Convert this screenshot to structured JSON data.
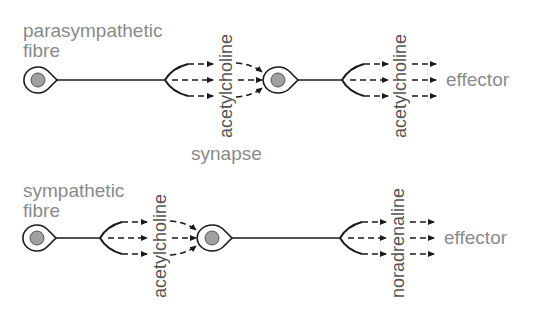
{
  "diagram": {
    "title": "",
    "rows": [
      {
        "id": "parasympathetic",
        "fibre_label_line1": "parasympathetic",
        "fibre_label_line2": "fibre",
        "first_transmitter": "acetylcholine",
        "second_transmitter": "acetylcholine",
        "synapse_label": "synapse",
        "target_label": "effector"
      },
      {
        "id": "sympathetic",
        "fibre_label_line1": "sympathetic",
        "fibre_label_line2": "fibre",
        "first_transmitter": "acetylcholine",
        "second_transmitter": "noradrenaline",
        "target_label": "effector"
      }
    ],
    "colors": {
      "label_text": "#8a8a8a",
      "vertical_text": "#555555",
      "line": "#1a1a1a",
      "nucleus": "#a0a0a0"
    }
  }
}
